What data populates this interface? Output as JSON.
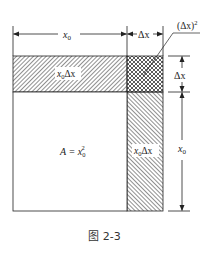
{
  "figure": {
    "caption": "图 2-3",
    "colors": {
      "line": "#222222",
      "hatch": "#333333",
      "background": "#ffffff"
    }
  },
  "labels": {
    "top_x0": "x",
    "top_x0_sub": "0",
    "top_dx": "Δx",
    "dx_squared": "(Δx)",
    "dx_squared_sup": "2",
    "right_dx": "Δx",
    "right_x0": "x",
    "right_x0_sub": "0",
    "top_strip": "x",
    "top_strip_sub": "0",
    "top_strip_tail": "Δx",
    "right_strip": "x",
    "right_strip_sub": "0",
    "right_strip_tail": "Δx",
    "area": "A = x",
    "area_sub": "0",
    "area_sup": "2"
  },
  "regions": [
    {
      "name": "square",
      "label": "A = x0^2",
      "fill": "none"
    },
    {
      "name": "top-strip",
      "label": "x0Δx",
      "fill": "diagonal-hatch"
    },
    {
      "name": "right-strip",
      "label": "x0Δx",
      "fill": "diagonal-hatch-reverse"
    },
    {
      "name": "corner",
      "label": "(Δx)^2",
      "fill": "cross-hatch"
    }
  ]
}
